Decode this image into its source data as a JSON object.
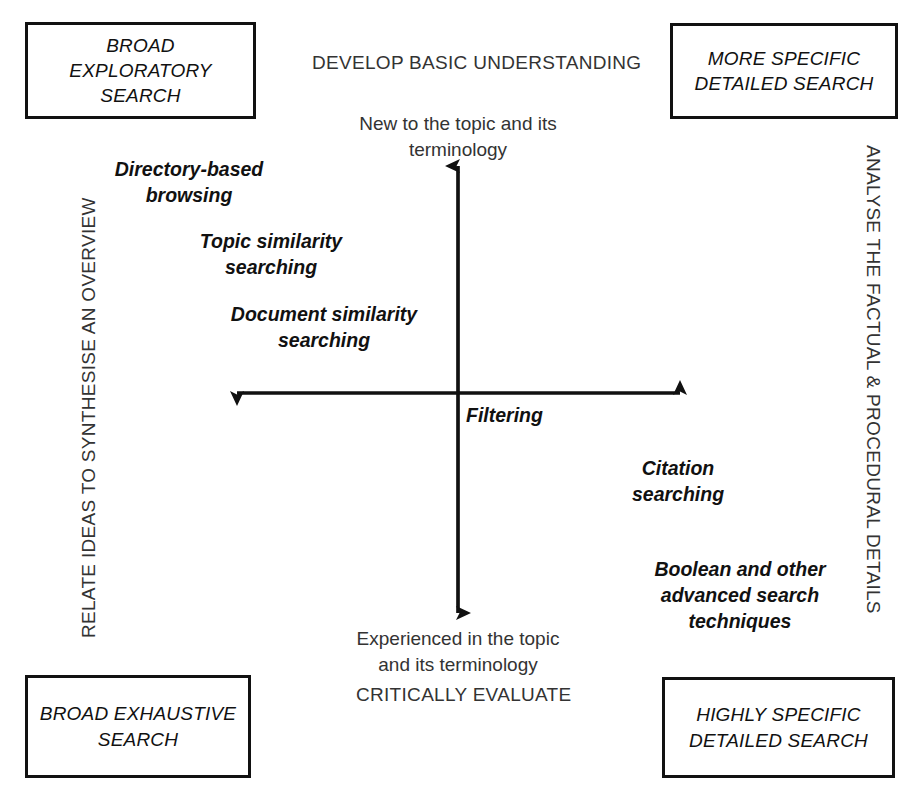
{
  "diagram": {
    "axes": {
      "vertical": {
        "top_headline": "DEVELOP BASIC UNDERSTANDING",
        "top_pole": "New to the topic and its\nterminology",
        "bottom_headline": "CRITICALLY EVALUATE",
        "bottom_pole": "Experienced in the topic\nand its terminology"
      },
      "horizontal": {
        "left_caption": "RELATE IDEAS TO SYNTHESISE AN OVERVIEW",
        "right_caption": "ANALYSE THE FACTUAL & PROCEDURAL DETAILS"
      }
    },
    "corner_boxes": [
      {
        "id": "top-left",
        "label": "BROAD\nEXPLORATORY\nSEARCH"
      },
      {
        "id": "top-right",
        "label": "MORE SPECIFIC\nDETAILED SEARCH"
      },
      {
        "id": "bottom-left",
        "label": "BROAD EXHAUSTIVE\nSEARCH"
      },
      {
        "id": "bottom-right",
        "label": "HIGHLY SPECIFIC\nDETAILED SEARCH"
      }
    ],
    "strategies": [
      {
        "label": "Directory-based\nbrowsing"
      },
      {
        "label": "Topic similarity\nsearching"
      },
      {
        "label": "Document similarity\nsearching"
      },
      {
        "label": "Filtering"
      },
      {
        "label": "Citation\nsearching"
      },
      {
        "label": "Boolean and other\nadvanced search\ntechniques"
      }
    ],
    "colors": {
      "line": "#111111",
      "box_border": "#111111",
      "text": "#333333",
      "background": "#ffffff"
    }
  }
}
